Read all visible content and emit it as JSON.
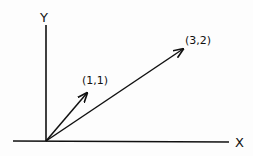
{
  "diagram": {
    "axes": {
      "x_label": "X",
      "y_label": "Y"
    },
    "vectors": [
      {
        "label": "(1,1)",
        "x": 1,
        "y": 1
      },
      {
        "label": "(3,2)",
        "x": 3,
        "y": 2
      }
    ],
    "colors": {
      "ink": "#111111",
      "background": "#fdfdfd"
    }
  }
}
